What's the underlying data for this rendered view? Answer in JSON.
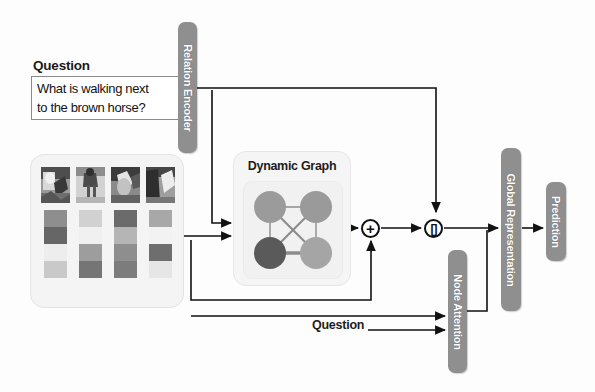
{
  "diagram": {
    "background_color": "#fdfdfd"
  },
  "question_block": {
    "title": "Question",
    "text": "What is walking next\nto the brown horse?"
  },
  "modules": {
    "relation_encoder": {
      "label": "Relation Encoder",
      "color": "#8f8f8f"
    },
    "node_attention": {
      "label": "Node Attention",
      "color": "#8f8f8f"
    },
    "global_representation": {
      "label": "Global Representation",
      "color": "#8f8f8f"
    },
    "prediction": {
      "label": "Prediction",
      "color": "#8f8f8f"
    }
  },
  "dynamic_graph": {
    "title": "Dynamic Graph",
    "nodes": [
      {
        "id": "n1",
        "position": "top-left",
        "color": "#9b9b9b",
        "cx": 26,
        "cy": 25,
        "r": 16
      },
      {
        "id": "n2",
        "position": "top-right",
        "color": "#9a9a9a",
        "cx": 72,
        "cy": 25,
        "r": 16
      },
      {
        "id": "n3",
        "position": "bottom-left",
        "color": "#5a5a5a",
        "cx": 26,
        "cy": 71,
        "r": 16
      },
      {
        "id": "n4",
        "position": "bottom-right",
        "color": "#a5a5a5",
        "cx": 72,
        "cy": 71,
        "r": 16
      }
    ],
    "edges": [
      {
        "from": "n1",
        "to": "n2",
        "weight": "thin"
      },
      {
        "from": "n1",
        "to": "n3",
        "weight": "thin"
      },
      {
        "from": "n2",
        "to": "n4",
        "weight": "thin"
      },
      {
        "from": "n3",
        "to": "n4",
        "weight": "thick"
      },
      {
        "from": "n1",
        "to": "n4",
        "weight": "medium"
      },
      {
        "from": "n2",
        "to": "n3",
        "weight": "medium"
      }
    ]
  },
  "image_panel": {
    "regions": [
      {
        "index": 1,
        "thumbnail_alt": "horse region 1",
        "feature_values": [
          "#8e8e8e",
          "#666666",
          "#ededed",
          "#c9c9c9"
        ]
      },
      {
        "index": 2,
        "thumbnail_alt": "horse region 2",
        "feature_values": [
          "#d1d1d1",
          "#f0f0f0",
          "#9d9d9d",
          "#757575"
        ]
      },
      {
        "index": 3,
        "thumbnail_alt": "horse region 3",
        "feature_values": [
          "#6b6b6b",
          "#b5b5b5",
          "#8e8e8e",
          "#7c7c7c"
        ]
      },
      {
        "index": 4,
        "thumbnail_alt": "horse region 4",
        "feature_values": [
          "#a8a8a8",
          "#f2f2f2",
          "#6e6e6e",
          "#e6e6e6"
        ]
      }
    ]
  },
  "operators": {
    "add": {
      "symbol": "+",
      "name": "element-wise addition"
    },
    "concat": {
      "symbol": "[]",
      "name": "concatenation"
    }
  },
  "labels": {
    "question_bottom": "Question"
  },
  "colors": {
    "module_fill": "#8f8f8f",
    "module_text": "#ffffff",
    "wire": "#111111",
    "panel_fill": "#f4f4f4",
    "node_dark": "#5a5a5a",
    "node_mid": "#9b9b9b",
    "node_light": "#a5a5a5"
  }
}
